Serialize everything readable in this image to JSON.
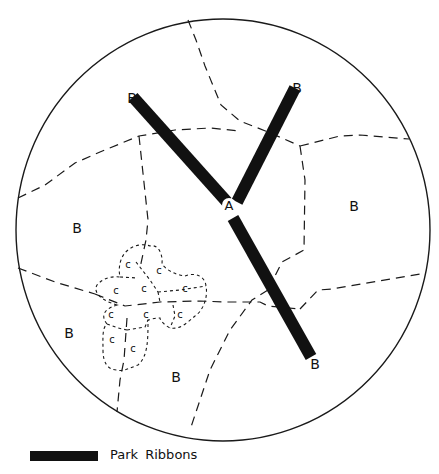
{
  "diagram": {
    "type": "urban-structure-diagram",
    "boundary": {
      "shape": "circle",
      "cx": 223,
      "cy": 230,
      "rx": 207,
      "ry": 211
    },
    "center_label": {
      "text": "A",
      "x": 229,
      "y": 209
    },
    "park_ribbons": [
      {
        "id": "ribbon-northwest",
        "from": [
          133,
          97
        ],
        "to": [
          227,
          202
        ],
        "end_label": "B",
        "label_pos": [
          126,
          99
        ]
      },
      {
        "id": "ribbon-northeast",
        "from": [
          295,
          88
        ],
        "to": [
          237,
          202
        ],
        "end_label": "B",
        "label_pos": [
          296,
          92
        ]
      },
      {
        "id": "ribbon-southeast",
        "from": [
          233,
          218
        ],
        "to": [
          311,
          357
        ],
        "end_label": "B",
        "label_pos": [
          313,
          367
        ]
      }
    ],
    "b_labels": [
      {
        "text": "B",
        "x": 77,
        "y": 232
      },
      {
        "text": "B",
        "x": 352,
        "y": 210
      },
      {
        "text": "B",
        "x": 69,
        "y": 336
      },
      {
        "text": "B",
        "x": 176,
        "y": 380
      }
    ],
    "c_labels": [
      {
        "text": "c",
        "x": 128,
        "y": 268
      },
      {
        "text": "c",
        "x": 159,
        "y": 274
      },
      {
        "text": "c",
        "x": 116,
        "y": 294
      },
      {
        "text": "c",
        "x": 144,
        "y": 292
      },
      {
        "text": "c",
        "x": 185,
        "y": 292
      },
      {
        "text": "c",
        "x": 111,
        "y": 318
      },
      {
        "text": "c",
        "x": 146,
        "y": 318
      },
      {
        "text": "c",
        "x": 180,
        "y": 318
      },
      {
        "text": "c",
        "x": 112,
        "y": 343
      },
      {
        "text": "c",
        "x": 133,
        "y": 352
      }
    ]
  },
  "legend": {
    "items": [
      {
        "swatch": "park-ribbon",
        "label": "Park  Ribbons",
        "color": "#111111"
      }
    ]
  }
}
